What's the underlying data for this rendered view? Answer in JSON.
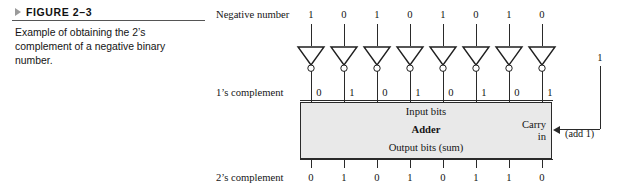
{
  "figure": {
    "label": "FIGURE 2–3",
    "caption": "Example of obtaining the 2’s complement of a negative binary number.",
    "marker_icon": "triangle-right-icon"
  },
  "diagram": {
    "rows": {
      "negative_number": {
        "label": "Negative number",
        "bits": [
          "1",
          "0",
          "1",
          "0",
          "1",
          "0",
          "1",
          "0"
        ]
      },
      "ones_complement": {
        "label": "1’s complement",
        "bits": [
          "0",
          "1",
          "0",
          "1",
          "0",
          "1",
          "0",
          "1"
        ]
      },
      "twos_complement": {
        "label": "2’s complement",
        "bits": [
          "0",
          "1",
          "0",
          "1",
          "0",
          "1",
          "1",
          "0"
        ]
      }
    },
    "adder": {
      "input_bits_label": "Input bits",
      "title": "Adder",
      "output_bits_label": "Output bits (sum)",
      "carry_in_line1": "Carry",
      "carry_in_line2": "in",
      "fill_color": "#e9e9e9",
      "border_color": "#2a2a2a"
    },
    "carry": {
      "bit": "1",
      "add_one_label": "(add 1)"
    },
    "inverters": {
      "count": 8,
      "icon": "inverter-triangle-icon",
      "bubble_icon": "inverting-bubble-icon"
    }
  }
}
